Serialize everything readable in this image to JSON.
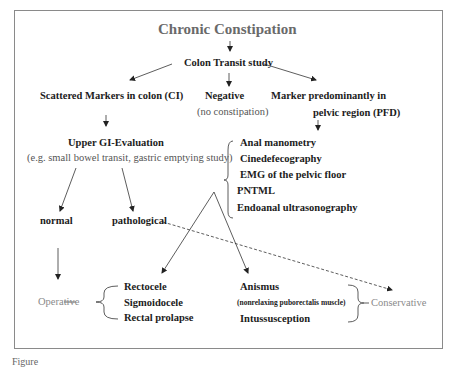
{
  "title": "Chronic Constipation",
  "colon_transit": "Colon Transit study",
  "branches": {
    "scattered": "Scattered Markers in colon (CI)",
    "negative": "Negative",
    "negative_note": "(no constipation)",
    "marker_line1": "Marker predominantly in",
    "marker_line2": "pelvic region (PFD)"
  },
  "upper_gi": {
    "title": "Upper GI-Evaluation",
    "note": "(e.g. small bowel transit, gastric emptying study)"
  },
  "pfd_tests": [
    "Anal manometry",
    "Cinedefecography",
    "EMG of the pelvic floor",
    "PNTML",
    "Endoanal ultrasonography"
  ],
  "outcomes": {
    "normal": "normal",
    "pathological": "pathological"
  },
  "operative": {
    "label": "Operative",
    "items": [
      "Rectocele",
      "Sigmoidocele",
      "Rectal prolapse"
    ]
  },
  "conservative": {
    "label": "Conservative",
    "items": [
      "Anismus",
      "(nonrelaxing puborectalis muscle)",
      "Intussusception"
    ]
  },
  "caption": "Figure"
}
